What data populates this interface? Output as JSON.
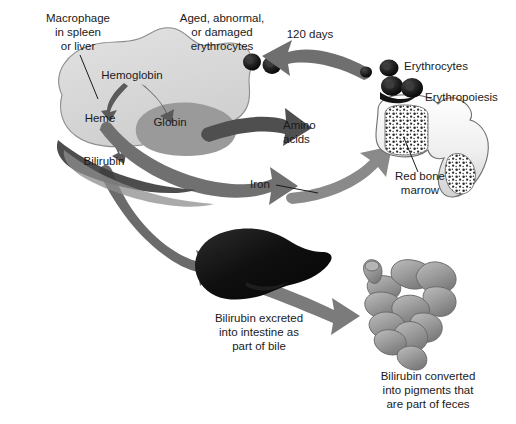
{
  "figure": {
    "background": "#ffffff"
  },
  "palette": {
    "macrophage_fill": "#d9d9d9",
    "macrophage_stroke": "#8c8c8c",
    "globin_fill": "#9a9a9a",
    "arrow_dark": "#4f4f4f",
    "arrow_mid": "#707070",
    "arrow_light": "#8e8e8e",
    "erythrocyte_dark": "#1c1c1c",
    "liver_dark": "#141414",
    "bone_fill": "#f2f2f2",
    "bone_stroke": "#6e6e6e",
    "marrow_stipple": "#2b2b2b",
    "intestine_fill": "#9e9e9e",
    "text": "#1a1a1a"
  },
  "labels": {
    "macrophage": {
      "lines": [
        "Macrophage",
        "in spleen",
        "or liver"
      ],
      "x": 78,
      "y": 22
    },
    "aged_erythrocytes": {
      "lines": [
        "Aged, abnormal,",
        "or damaged",
        "erythrocytes"
      ],
      "x": 222,
      "y": 22
    },
    "hemoglobin": {
      "text": "Hemoglobin",
      "x": 132,
      "y": 79
    },
    "heme": {
      "text": "Heme",
      "x": 100,
      "y": 122
    },
    "globin": {
      "text": "Globin",
      "x": 170,
      "y": 126
    },
    "bilirubin": {
      "text": "Bilirubin",
      "x": 104,
      "y": 165
    },
    "days_120": {
      "text": "120 days",
      "x": 310,
      "y": 38
    },
    "erythrocytes": {
      "text": "Erythrocytes",
      "x": 404,
      "y": 70
    },
    "erythropoiesis": {
      "text": "Erythropoiesis",
      "x": 425,
      "y": 101
    },
    "amino_acids": {
      "lines": [
        "Amino",
        "acids"
      ],
      "x": 283,
      "y": 129
    },
    "iron": {
      "text": "Iron",
      "x": 262,
      "y": 188
    },
    "red_bone_marrow": {
      "lines": [
        "Red bone",
        "marrow"
      ],
      "x": 420,
      "y": 180
    },
    "liver": {
      "text": "Liver",
      "x": 222,
      "y": 259
    },
    "bilirubin_excreted": {
      "lines": [
        "Bilirubin excreted",
        "into intestine as",
        "part of bile"
      ],
      "x": 259,
      "y": 322
    },
    "bilirubin_converted": {
      "lines": [
        "Bilirubin converted",
        "into pigments that",
        "are part of feces"
      ],
      "x": 428,
      "y": 380
    }
  },
  "flow": {
    "steps": [
      "Aged, abnormal, or damaged erythrocytes",
      "Macrophage in spleen or liver",
      "Hemoglobin",
      "Heme",
      "Globin",
      "Bilirubin",
      "Amino acids",
      "Iron",
      "Red bone marrow",
      "Erythropoiesis",
      "Erythrocytes",
      "Liver",
      "Intestine"
    ],
    "lifespan": "120 days"
  }
}
